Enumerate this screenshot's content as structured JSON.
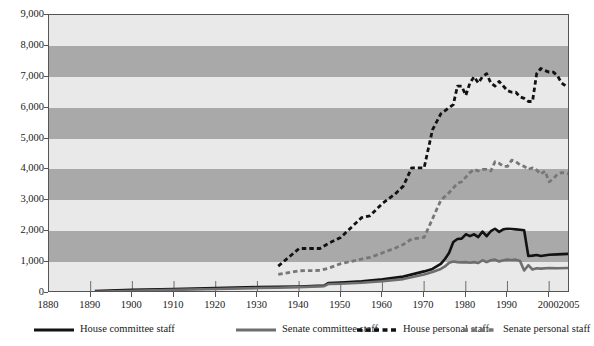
{
  "chart_data": {
    "type": "line",
    "title": "",
    "xlabel": "",
    "ylabel": "",
    "xlim": [
      1880,
      2005
    ],
    "ylim": [
      0,
      9000
    ],
    "grid": "horizontal-alternating-bands",
    "legend_position": "bottom",
    "y_ticks": [
      "9,000",
      "8,000",
      "7,000",
      "6,000",
      "5,000",
      "4,000",
      "3,000",
      "2,000",
      "1,000",
      "0"
    ],
    "y_tick_values": [
      9000,
      8000,
      7000,
      6000,
      5000,
      4000,
      3000,
      2000,
      1000,
      0
    ],
    "x_ticks": [
      "1880",
      "1890",
      "1900",
      "1910",
      "1920",
      "1930",
      "1940",
      "1950",
      "1960",
      "1970",
      "1980",
      "1990",
      "2000",
      "2005"
    ],
    "x_tick_values": [
      1880,
      1890,
      1900,
      1910,
      1920,
      1930,
      1940,
      1950,
      1960,
      1970,
      1980,
      1990,
      2000,
      2005
    ],
    "colors": {
      "house_committee": "#121212",
      "senate_committee": "#6e6e6e",
      "house_personal": "#121212",
      "senate_personal": "#777777",
      "band_light": "#e9e9e9",
      "band_dark": "#a9a9a9",
      "frame": "#555555",
      "text": "#1a1a1a"
    },
    "series": [
      {
        "name": "House committee staff",
        "style": "solid",
        "color": "#121212",
        "width": 2.6,
        "x": [
          1891,
          1900,
          1910,
          1920,
          1930,
          1935,
          1940,
          1946,
          1947,
          1950,
          1955,
          1960,
          1965,
          1970,
          1972,
          1974,
          1975,
          1976,
          1977,
          1978,
          1979,
          1980,
          1981,
          1982,
          1983,
          1984,
          1985,
          1986,
          1987,
          1988,
          1989,
          1990,
          1991,
          1992,
          1993,
          1994,
          1995,
          1996,
          1997,
          1998,
          2000,
          2002,
          2005
        ],
        "y": [
          62,
          100,
          130,
          160,
          190,
          200,
          210,
          240,
          320,
          340,
          380,
          440,
          530,
          700,
          780,
          940,
          1100,
          1300,
          1650,
          1750,
          1760,
          1900,
          1840,
          1900,
          1810,
          1990,
          1840,
          2000,
          2080,
          1980,
          2060,
          2080,
          2070,
          2060,
          2050,
          2030,
          1200,
          1210,
          1230,
          1200,
          1240,
          1250,
          1270
        ]
      },
      {
        "name": "Senate committee staff",
        "style": "solid",
        "color": "#6e6e6e",
        "width": 2.6,
        "x": [
          1891,
          1900,
          1910,
          1920,
          1930,
          1935,
          1940,
          1946,
          1947,
          1950,
          1955,
          1960,
          1965,
          1970,
          1972,
          1974,
          1975,
          1976,
          1977,
          1978,
          1979,
          1980,
          1981,
          1982,
          1983,
          1984,
          1985,
          1986,
          1987,
          1988,
          1989,
          1990,
          1991,
          1992,
          1993,
          1994,
          1995,
          1996,
          1997,
          1998,
          2000,
          2002,
          2005
        ],
        "y": [
          41,
          70,
          100,
          130,
          160,
          170,
          190,
          220,
          290,
          300,
          330,
          380,
          450,
          600,
          680,
          780,
          860,
          980,
          1020,
          1000,
          990,
          1000,
          980,
          1000,
          970,
          1060,
          1000,
          1060,
          1080,
          1020,
          1060,
          1080,
          1070,
          1080,
          1040,
          730,
          900,
          760,
          800,
          790,
          810,
          800,
          810
        ]
      },
      {
        "name": "House personal staff",
        "style": "dashed",
        "color": "#121212",
        "width": 2.8,
        "x": [
          1935,
          1940,
          1945,
          1947,
          1950,
          1955,
          1957,
          1960,
          1963,
          1965,
          1967,
          1970,
          1972,
          1974,
          1976,
          1977,
          1978,
          1979,
          1980,
          1981,
          1982,
          1983,
          1984,
          1985,
          1986,
          1987,
          1988,
          1989,
          1990,
          1991,
          1992,
          1993,
          1994,
          1995,
          1996,
          1997,
          1998,
          1999,
          2000,
          2001,
          2002,
          2003,
          2004,
          2005
        ],
        "y": [
          870,
          1440,
          1440,
          1600,
          1800,
          2440,
          2500,
          2900,
          3200,
          3460,
          4050,
          4050,
          5280,
          5800,
          6000,
          6100,
          6700,
          6700,
          6400,
          6800,
          7000,
          6800,
          7000,
          7100,
          6800,
          6700,
          6850,
          6700,
          6550,
          6500,
          6500,
          6350,
          6300,
          6200,
          6200,
          7100,
          7270,
          7200,
          7150,
          7150,
          7030,
          6800,
          6700,
          6700
        ]
      },
      {
        "name": "Senate personal staff",
        "style": "dashed",
        "color": "#777777",
        "width": 2.8,
        "x": [
          1935,
          1940,
          1945,
          1947,
          1950,
          1955,
          1957,
          1960,
          1963,
          1965,
          1967,
          1970,
          1972,
          1974,
          1976,
          1977,
          1978,
          1979,
          1980,
          1981,
          1982,
          1983,
          1984,
          1985,
          1986,
          1987,
          1988,
          1989,
          1990,
          1991,
          1992,
          1993,
          1994,
          1995,
          1996,
          1997,
          1998,
          1999,
          2000,
          2001,
          2002,
          2003,
          2004,
          2005
        ],
        "y": [
          600,
          720,
          730,
          800,
          950,
          1100,
          1150,
          1300,
          1450,
          1570,
          1750,
          1800,
          2400,
          3000,
          3250,
          3400,
          3550,
          3600,
          3750,
          3900,
          4000,
          3950,
          4000,
          4000,
          3950,
          4250,
          4200,
          4100,
          4100,
          4300,
          4250,
          4150,
          4100,
          4000,
          4050,
          3980,
          3850,
          3950,
          3600,
          3700,
          3850,
          3900,
          3880,
          3850
        ]
      }
    ]
  },
  "legend": {
    "items": [
      {
        "label": "House committee staff",
        "style": "solid",
        "color": "#121212"
      },
      {
        "label": "Senate committee staff",
        "style": "solid",
        "color": "#6e6e6e"
      },
      {
        "label": "House personal staff",
        "style": "dashed",
        "color": "#121212"
      },
      {
        "label": "Senate personal staff",
        "style": "dashed",
        "color": "#777777"
      }
    ]
  }
}
